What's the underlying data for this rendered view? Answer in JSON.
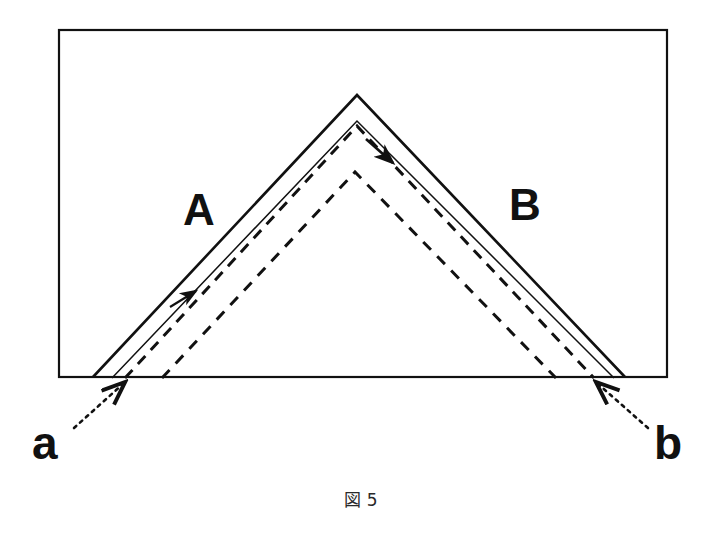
{
  "figure": {
    "caption": "図 5",
    "frame": {
      "x": 59,
      "y": 30,
      "width": 608,
      "height": 347,
      "stroke_color": "#111111",
      "stroke_width": 2.2
    },
    "region_labels": [
      {
        "id": "A",
        "text": "A",
        "x": 200,
        "y": 210
      },
      {
        "id": "B",
        "text": "B",
        "x": 525,
        "y": 205
      }
    ],
    "point_labels": [
      {
        "id": "a",
        "text": "a",
        "x": 48,
        "y": 448,
        "target_x": 124,
        "target_y": 379
      },
      {
        "id": "b",
        "text": "b",
        "x": 672,
        "y": 448,
        "target_x": 596,
        "target_y": 379
      }
    ],
    "colors": {
      "ink": "#111111",
      "paper": "#ffffff",
      "caption_ink": "#2a2a2a"
    },
    "geometry": {
      "baseline_y": 377,
      "apex_x": 357,
      "outer_solid": {
        "name": "outer-solid-triangle",
        "apex": [
          357,
          95
        ],
        "left_base": [
          93,
          377
        ],
        "right_base": [
          625,
          377
        ],
        "style": "solid",
        "stroke_width": 2.6
      },
      "inner_solid": {
        "name": "inner-solid-chevron",
        "apex": [
          357,
          122
        ],
        "left_base": [
          110,
          378
        ],
        "right_base": [
          612,
          378
        ],
        "style": "solid",
        "stroke_width": 1.5
      },
      "middle_dashed": {
        "name": "middle-dashed-triangle",
        "apex": [
          357,
          126
        ],
        "left_base": [
          125,
          378
        ],
        "right_base": [
          594,
          378
        ],
        "style": "dashed",
        "stroke_width": 3.0,
        "dash": "11 8"
      },
      "inner_dashed": {
        "name": "inner-dashed-triangle",
        "apex": [
          355,
          172
        ],
        "left_base": [
          162,
          378
        ],
        "right_base": [
          556,
          378
        ],
        "style": "dashed",
        "stroke_width": 3.0,
        "dash": "11 9"
      }
    },
    "arrows": [
      {
        "id": "arrow-left-up",
        "direction": "up-right",
        "from": [
          176,
          303
        ],
        "to": [
          199,
          288
        ]
      },
      {
        "id": "arrow-apex-down",
        "direction": "down-right",
        "from": [
          366,
          138
        ],
        "to": [
          396,
          165
        ]
      }
    ]
  }
}
